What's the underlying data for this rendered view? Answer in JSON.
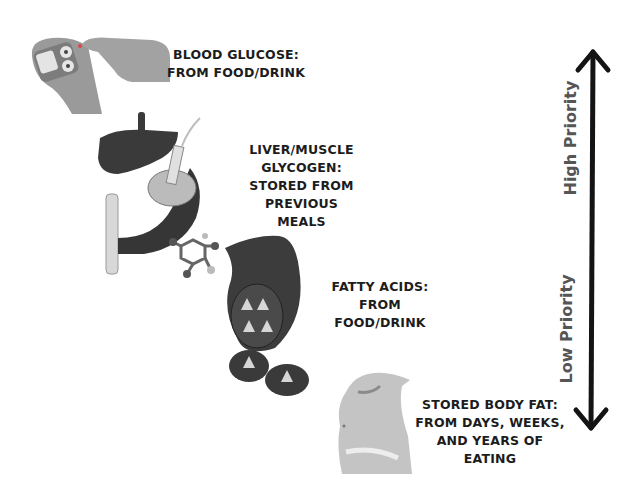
{
  "diagram": {
    "stages": [
      {
        "id": "blood-glucose",
        "icon": "finger-prick-glucose-meter-icon",
        "lines": [
          "BLOOD GLUCOSE:",
          "FROM FOOD/DRINK"
        ]
      },
      {
        "id": "glycogen",
        "icon": "liver-muscle-icon",
        "lines": [
          "LIVER/MUSCLE GLYCOGEN:",
          "STORED FROM PREVIOUS",
          "MEALS"
        ]
      },
      {
        "id": "fatty-acids",
        "icon": "fat-cell-icon",
        "lines": [
          "FATTY ACIDS: FROM",
          "FOOD/DRINK"
        ]
      },
      {
        "id": "body-fat",
        "icon": "belly-fat-icon",
        "lines": [
          "STORED BODY FAT:",
          "FROM DAYS, WEEKS,",
          "AND YEARS OF EATING"
        ]
      }
    ],
    "axis": {
      "high_label": "High Priority",
      "low_label": "Low Priority",
      "arrow_color": "#141414",
      "label_color": "#555555"
    }
  }
}
